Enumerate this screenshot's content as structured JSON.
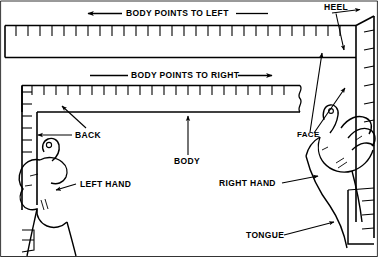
{
  "figure": {
    "width": 378,
    "height": 258,
    "ink_color": "#000000",
    "background_color": "#ffffff"
  },
  "callouts": {
    "body_points_to_left": "BODY POINTS TO LEFT",
    "body_points_to_right": "BODY POINTS TO RIGHT",
    "heel": "HEEL",
    "back": "BACK",
    "body": "BODY",
    "face": "FACE",
    "left_hand": "LEFT HAND",
    "right_hand": "RIGHT HAND",
    "tongue": "TONGUE"
  },
  "parts": [
    {
      "name": "HEEL"
    },
    {
      "name": "BACK"
    },
    {
      "name": "BODY"
    },
    {
      "name": "FACE"
    },
    {
      "name": "TONGUE"
    },
    {
      "name": "LEFT HAND"
    },
    {
      "name": "RIGHT HAND"
    }
  ],
  "orientations": [
    {
      "label": "BODY POINTS TO LEFT",
      "direction": "left"
    },
    {
      "label": "BODY POINTS TO RIGHT",
      "direction": "right"
    }
  ]
}
